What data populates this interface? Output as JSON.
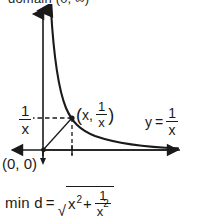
{
  "figure": {
    "domain_caption": "domain (0, ∞)",
    "origin_label": "(0, 0)",
    "curve_equation": {
      "lhs": "y",
      "equals": "=",
      "numerator": "1",
      "denominator": "x"
    },
    "y_axis_value": {
      "numerator": "1",
      "denominator": "x"
    },
    "point_label": {
      "open_paren": "(",
      "x_part": "x",
      "comma": ",",
      "numerator": "1",
      "denominator": "x",
      "close_paren": ")"
    }
  },
  "min_distance": {
    "lead": "min d",
    "equals": "=",
    "radical_sign": "√",
    "term1_base": "x",
    "term1_exp": "2",
    "plus": "+",
    "frac_numerator": "1",
    "frac_den_base": "x",
    "frac_den_exp": "2"
  },
  "colors": {
    "ink": "#1a1a1a",
    "background": "#ffffff"
  }
}
